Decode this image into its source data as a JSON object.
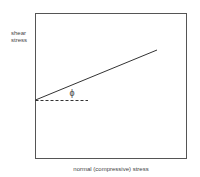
{
  "diagram": {
    "type": "mohr-coulomb failure envelope",
    "y_axis_label_line1": "shear",
    "y_axis_label_line2": "stress",
    "x_axis_label": "normal (compressive) stress",
    "angle_label": "ϕ",
    "line_color": "#333333",
    "frame_color": "#555555"
  }
}
